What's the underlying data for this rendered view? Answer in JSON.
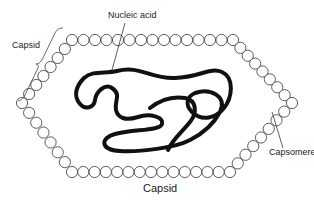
{
  "diagram": {
    "labels": {
      "nucleic_acid": "Nucleic acid",
      "capsid_left": "Capsid",
      "capsid_bottom": "Capsid",
      "capsomere": "Capsomere"
    },
    "colors": {
      "line": "#1a1a1a",
      "capsomere_stroke": "#444444",
      "background": "#ffffff"
    }
  }
}
